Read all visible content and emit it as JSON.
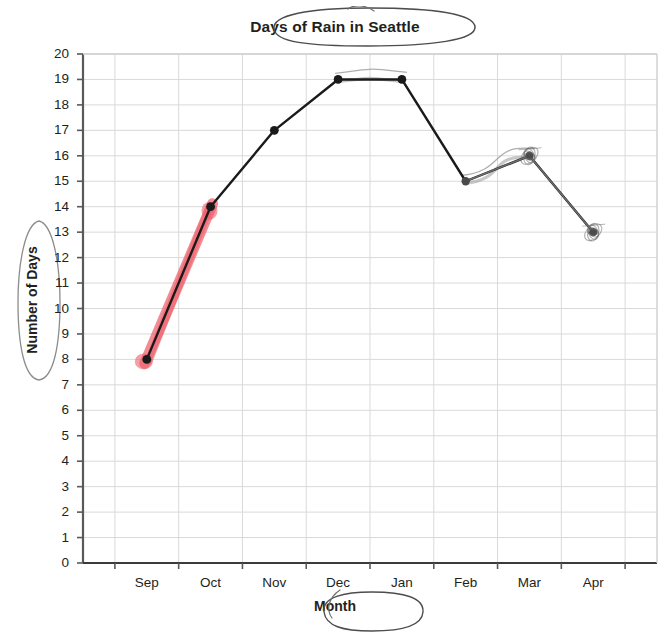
{
  "chart_data": {
    "type": "line",
    "title": "Days of Rain in Seattle",
    "xlabel": "Month",
    "ylabel": "Number of Days",
    "categories": [
      "Sep",
      "Oct",
      "Nov",
      "Dec",
      "Jan",
      "Feb",
      "Mar",
      "Apr"
    ],
    "values": [
      8,
      14,
      17,
      19,
      19,
      15,
      16,
      13
    ],
    "series": [
      {
        "name": "Days of Rain",
        "values": [
          8,
          14,
          17,
          19,
          19,
          15,
          16,
          13
        ]
      }
    ],
    "ylim": [
      0,
      20
    ],
    "ytick_step": 1,
    "yticks": [
      0,
      1,
      2,
      3,
      4,
      5,
      6,
      7,
      8,
      9,
      10,
      11,
      12,
      13,
      14,
      15,
      16,
      17,
      18,
      19,
      20
    ],
    "grid": true,
    "legend": "none",
    "line_color": "#1a1a1a",
    "marker_color": "#1a1a1a",
    "grid_color": "#d9d9d9",
    "axis_color": "#58595b",
    "annotations": [
      {
        "kind": "highlight-stroke",
        "name": "red-highlight-sep-to-oct",
        "color": "#ef5f6b",
        "from_category": "Sep",
        "to_category": "Oct",
        "from_value": 8,
        "to_value": 14
      },
      {
        "kind": "oval",
        "name": "title-oval",
        "target": "Days of Rain in Seattle",
        "color": "#4d4d4d"
      },
      {
        "kind": "oval",
        "name": "xaxis-title-oval",
        "target": "Month",
        "color": "#4d4d4d"
      },
      {
        "kind": "oval",
        "name": "yaxis-title-oval",
        "target": "Number of Days",
        "color": "#8c8c8c"
      },
      {
        "kind": "traced-segment",
        "name": "pencil-trace-dec-to-jan",
        "from_category": "Dec",
        "to_category": "Jan",
        "color": "#9b9b9b"
      },
      {
        "kind": "traced-segment",
        "name": "pencil-trace-feb-to-mar",
        "from_category": "Feb",
        "to_category": "Mar",
        "color": "#9b9b9b"
      },
      {
        "kind": "scribble-marker",
        "name": "scribble-over-mar-point",
        "target_category": "Mar",
        "target_value": 16,
        "color": "#6e6e6e"
      },
      {
        "kind": "scribble-marker",
        "name": "scribble-over-apr-point",
        "target_category": "Apr",
        "target_value": 13,
        "color": "#6e6e6e"
      }
    ]
  }
}
